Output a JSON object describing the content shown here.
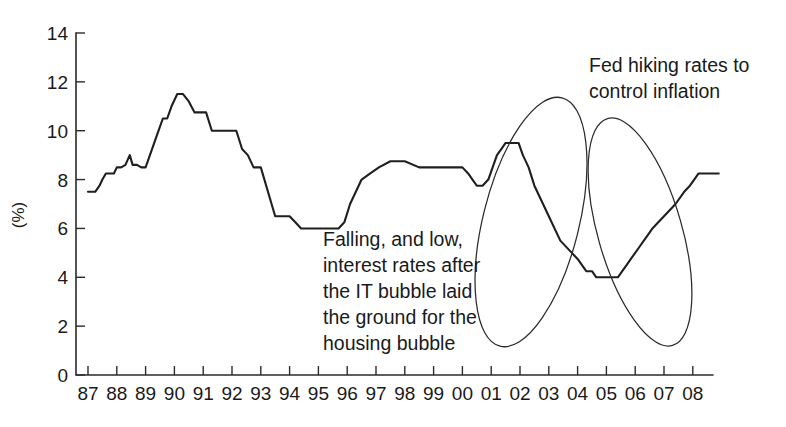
{
  "chart_data": {
    "type": "line",
    "title": "",
    "xlabel": "",
    "ylabel": "(%)",
    "ylim": [
      0,
      14
    ],
    "yticks": [
      0,
      2,
      4,
      6,
      8,
      10,
      12,
      14
    ],
    "ytick_labels": [
      "0",
      "2",
      "4",
      "6",
      "8",
      "10",
      "12",
      "14"
    ],
    "grid": false,
    "legend": "none",
    "categories": [
      "87",
      "88",
      "89",
      "90",
      "91",
      "92",
      "93",
      "94",
      "95",
      "96",
      "97",
      "98",
      "99",
      "00",
      "01",
      "02",
      "03",
      "04",
      "05",
      "06",
      "07",
      "08"
    ],
    "xtick_labels": [
      "87",
      "88",
      "89",
      "90",
      "91",
      "92",
      "93",
      "94",
      "95",
      "96",
      "97",
      "98",
      "99",
      "00",
      "01",
      "02",
      "03",
      "04",
      "05",
      "06",
      "07",
      "08"
    ],
    "series": [
      {
        "name": "interest rate",
        "color": "#1f1f1f",
        "x": [
          87.0,
          87.1,
          87.25,
          87.4,
          87.5,
          87.62,
          87.75,
          87.9,
          88.0,
          88.15,
          88.3,
          88.45,
          88.55,
          88.7,
          88.85,
          89.0,
          89.15,
          89.3,
          89.45,
          89.6,
          89.75,
          89.9,
          90.1,
          90.3,
          90.5,
          90.7,
          90.9,
          91.1,
          91.3,
          91.5,
          91.65,
          91.8,
          91.95,
          92.15,
          92.35,
          92.55,
          92.75,
          93.0,
          93.5,
          94.0,
          94.2,
          94.4,
          94.55,
          94.7,
          94.85,
          95.0,
          95.15,
          95.3,
          95.5,
          95.7,
          95.9,
          96.1,
          96.3,
          96.5,
          96.8,
          97.1,
          97.5,
          98.0,
          98.5,
          98.8,
          98.95,
          99.1,
          99.3,
          99.5,
          99.7,
          99.85,
          100.0,
          100.2,
          100.35,
          100.5,
          100.7,
          100.9,
          101.05,
          101.2,
          101.35,
          101.5,
          101.65,
          101.8,
          101.95,
          102.1,
          102.3,
          102.5,
          102.8,
          103.0,
          103.4,
          103.8,
          104.0,
          104.3,
          104.5,
          104.65,
          104.8,
          104.95,
          105.1,
          105.25,
          105.4,
          105.55,
          105.7,
          105.85,
          106.0,
          106.15,
          106.3,
          106.45,
          106.6,
          106.8,
          107.0,
          107.4,
          107.7,
          107.9,
          108.05,
          108.2,
          108.35,
          108.5,
          108.7,
          108.9
        ],
        "y": [
          7.5,
          7.5,
          7.5,
          7.75,
          8.0,
          8.25,
          8.25,
          8.25,
          8.5,
          8.5,
          8.6,
          9.0,
          8.6,
          8.6,
          8.5,
          8.5,
          9.0,
          9.5,
          10.0,
          10.5,
          10.5,
          11.0,
          11.5,
          11.5,
          11.2,
          10.75,
          10.75,
          10.75,
          10.0,
          10.0,
          10.0,
          10.0,
          10.0,
          10.0,
          9.25,
          9.0,
          8.5,
          8.5,
          6.5,
          6.5,
          6.25,
          6.0,
          6.0,
          6.0,
          6.0,
          6.0,
          6.0,
          6.0,
          6.0,
          6.0,
          6.25,
          7.0,
          7.5,
          8.0,
          8.25,
          8.5,
          8.75,
          8.75,
          8.5,
          8.5,
          8.5,
          8.5,
          8.5,
          8.5,
          8.5,
          8.5,
          8.5,
          8.25,
          8.0,
          7.75,
          7.75,
          8.0,
          8.5,
          9.0,
          9.25,
          9.5,
          9.5,
          9.5,
          9.5,
          9.0,
          8.5,
          7.75,
          7.0,
          6.5,
          5.5,
          5.0,
          4.75,
          4.25,
          4.25,
          4.0,
          4.0,
          4.0,
          4.0,
          4.0,
          4.0,
          4.25,
          4.5,
          4.75,
          5.0,
          5.25,
          5.5,
          5.75,
          6.0,
          6.25,
          6.5,
          7.0,
          7.5,
          7.75,
          8.0,
          8.25,
          8.25,
          8.25,
          8.25,
          8.25
        ]
      }
    ],
    "annotations": [
      {
        "id": "annotation-it-bubble",
        "lines": [
          "Falling, and low,",
          "interest rates after",
          "the IT bubble laid",
          "the ground for the",
          "housing bubble"
        ]
      },
      {
        "id": "annotation-fed-hiking",
        "lines": [
          "Fed hiking rates to",
          "control inflation"
        ]
      }
    ],
    "highlight_ellipses": [
      {
        "id": "ellipse-rate-cuts",
        "label": "falling-rates-2000-2003",
        "cx": 531,
        "cy": 222,
        "rx": 48,
        "ry": 128,
        "rotate": 14
      },
      {
        "id": "ellipse-rate-hikes",
        "label": "rising-rates-2004-2007",
        "cx": 640,
        "cy": 232,
        "rx": 42,
        "ry": 118,
        "rotate": -16
      }
    ]
  }
}
